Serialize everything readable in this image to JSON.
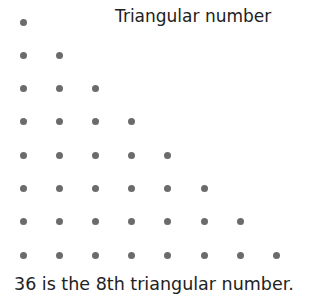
{
  "title": "Triangular number",
  "caption": "36 is the 8th triangular number.",
  "diagram": {
    "rows": 8,
    "total_dots": 36,
    "dot_color": "#6b6b6b",
    "origin_x": 23,
    "origin_y": 22,
    "spacing_x": 36.2,
    "spacing_y": 33.3
  }
}
